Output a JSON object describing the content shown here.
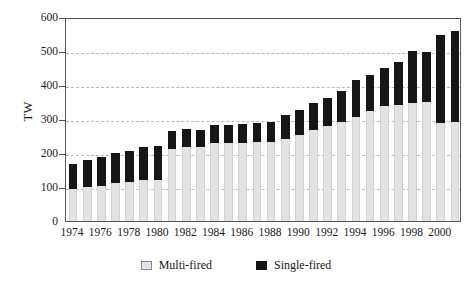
{
  "chart_data": {
    "type": "bar",
    "stacked": true,
    "title": "",
    "xlabel": "",
    "ylabel": "TW",
    "ylim": [
      0,
      600
    ],
    "ytick_values": [
      0,
      100,
      200,
      300,
      400,
      500,
      600
    ],
    "ytick_labels": [
      "0",
      "100",
      "200",
      "300",
      "400",
      "500",
      "600"
    ],
    "grid": "horizontal-dashed",
    "legend_position": "bottom-center",
    "categories": [
      "1974",
      "1975",
      "1976",
      "1977",
      "1978",
      "1979",
      "1980",
      "1981",
      "1982",
      "1983",
      "1984",
      "1985",
      "1986",
      "1987",
      "1988",
      "1989",
      "1990",
      "1991",
      "1992",
      "1993",
      "1994",
      "1995",
      "1996",
      "1997",
      "1998",
      "1999",
      "2000",
      "2001"
    ],
    "xtick_labels": [
      "1974",
      "1976",
      "1978",
      "1980",
      "1982",
      "1984",
      "1986",
      "1988",
      "1990",
      "1992",
      "1994",
      "1996",
      "1998",
      "2000"
    ],
    "series": [
      {
        "name": "Multi-fired",
        "color": "#e2e2e2",
        "values": [
          95,
          100,
          103,
          113,
          115,
          120,
          120,
          212,
          218,
          218,
          228,
          228,
          228,
          232,
          232,
          240,
          252,
          268,
          278,
          292,
          305,
          325,
          338,
          342,
          348,
          350,
          288,
          290
        ]
      },
      {
        "name": "Single-fired",
        "color": "#161616",
        "values": [
          73,
          80,
          85,
          88,
          92,
          97,
          100,
          53,
          52,
          50,
          53,
          55,
          57,
          57,
          60,
          72,
          75,
          78,
          85,
          90,
          110,
          105,
          112,
          125,
          152,
          148,
          260,
          268
        ]
      }
    ],
    "totals": [
      168,
      180,
      188,
      201,
      207,
      217,
      220,
      265,
      270,
      268,
      281,
      283,
      285,
      289,
      292,
      312,
      327,
      346,
      363,
      382,
      415,
      430,
      450,
      467,
      500,
      498,
      548,
      558
    ]
  },
  "legend": {
    "items": [
      {
        "label": "Multi-fired",
        "swatch": "multi"
      },
      {
        "label": "Single-fired",
        "swatch": "single"
      }
    ]
  }
}
